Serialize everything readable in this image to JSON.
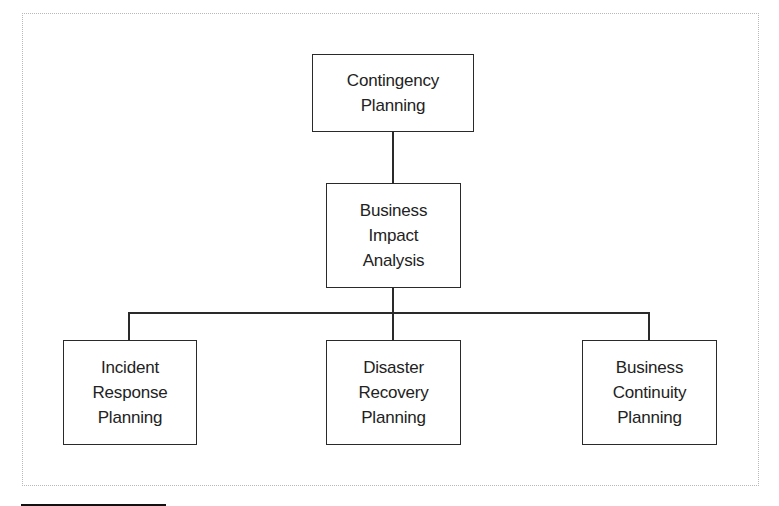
{
  "diagram": {
    "type": "hierarchy",
    "nodes": {
      "root": {
        "lines": [
          "Contingency",
          "Planning"
        ]
      },
      "middle": {
        "lines": [
          "Business",
          "Impact",
          "Analysis"
        ]
      },
      "left": {
        "lines": [
          "Incident",
          "Response",
          "Planning"
        ]
      },
      "center": {
        "lines": [
          "Disaster",
          "Recovery",
          "Planning"
        ]
      },
      "right": {
        "lines": [
          "Business",
          "Continuity",
          "Planning"
        ]
      }
    },
    "edges": [
      [
        "Contingency Planning",
        "Business Impact Analysis"
      ],
      [
        "Business Impact Analysis",
        "Incident Response Planning"
      ],
      [
        "Business Impact Analysis",
        "Disaster Recovery Planning"
      ],
      [
        "Business Impact Analysis",
        "Business Continuity Planning"
      ]
    ]
  }
}
